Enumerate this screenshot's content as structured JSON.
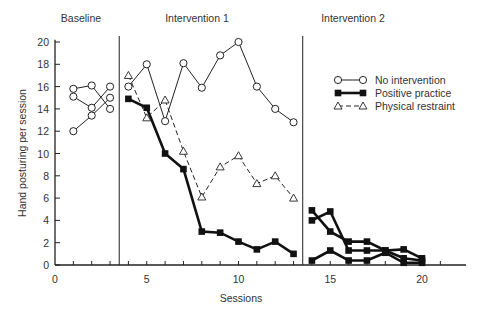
{
  "chart_data": {
    "type": "line",
    "title": "",
    "xlabel": "Sessions",
    "ylabel": "Hand posturing per session",
    "xlim": [
      0,
      22
    ],
    "ylim": [
      0,
      20
    ],
    "x_ticks": [
      0,
      5,
      10,
      15,
      20
    ],
    "y_ticks": [
      0,
      2,
      4,
      6,
      8,
      10,
      12,
      14,
      16,
      18,
      20
    ],
    "grid": false,
    "phases": [
      {
        "label": "Baseline",
        "start": 0,
        "end": 3.5
      },
      {
        "label": "Intervention 1",
        "start": 3.5,
        "end": 13.5
      },
      {
        "label": "Intervention 2",
        "start": 13.5,
        "end": 22
      }
    ],
    "legend": {
      "position": "upper right",
      "entries": [
        {
          "label": "No intervention",
          "marker": "open-circle",
          "line": "solid-thin"
        },
        {
          "label": "Positive practice",
          "marker": "filled-square",
          "line": "solid-thick"
        },
        {
          "label": "Physical restraint",
          "marker": "open-triangle",
          "line": "dashed"
        }
      ]
    },
    "series": [
      {
        "name": "Baseline A",
        "style": "open-circle",
        "points": [
          [
            1,
            15.8
          ],
          [
            2,
            16.1
          ],
          [
            3,
            14.0
          ]
        ]
      },
      {
        "name": "Baseline B",
        "style": "open-circle",
        "points": [
          [
            1,
            15.1
          ],
          [
            2,
            14.1
          ],
          [
            3,
            16.0
          ]
        ]
      },
      {
        "name": "Baseline C",
        "style": "open-circle",
        "points": [
          [
            1,
            12.0
          ],
          [
            2,
            13.4
          ],
          [
            3,
            15.0
          ]
        ]
      },
      {
        "name": "No intervention",
        "style": "open-circle",
        "points": [
          [
            4,
            16.0
          ],
          [
            5,
            18.0
          ],
          [
            6,
            12.9
          ],
          [
            7,
            18.1
          ],
          [
            8,
            15.9
          ],
          [
            9,
            18.8
          ],
          [
            10,
            20.0
          ],
          [
            11,
            16.0
          ],
          [
            12,
            14.0
          ],
          [
            13,
            12.8
          ]
        ]
      },
      {
        "name": "Positive practice",
        "style": "filled-square",
        "points": [
          [
            4,
            14.9
          ],
          [
            5,
            14.1
          ],
          [
            6,
            10.0
          ],
          [
            7,
            8.6
          ],
          [
            8,
            3.0
          ],
          [
            9,
            2.9
          ],
          [
            10,
            2.1
          ],
          [
            11,
            1.4
          ],
          [
            12,
            2.1
          ],
          [
            13,
            1.0
          ]
        ]
      },
      {
        "name": "Physical restraint",
        "style": "open-triangle",
        "points": [
          [
            4,
            17.0
          ],
          [
            5,
            13.2
          ],
          [
            6,
            14.8
          ],
          [
            7,
            10.2
          ],
          [
            8,
            6.1
          ],
          [
            9,
            8.8
          ],
          [
            10,
            9.8
          ],
          [
            11,
            7.3
          ],
          [
            12,
            8.0
          ],
          [
            13,
            6.0
          ]
        ]
      },
      {
        "name": "Intervention 2 A",
        "style": "filled-square",
        "points": [
          [
            14,
            4.9
          ],
          [
            15,
            3.0
          ],
          [
            16,
            2.1
          ],
          [
            17,
            2.1
          ],
          [
            18,
            1.3
          ],
          [
            19,
            0.6
          ],
          [
            20,
            0.4
          ]
        ]
      },
      {
        "name": "Intervention 2 B",
        "style": "filled-square",
        "points": [
          [
            14,
            4.0
          ],
          [
            15,
            4.8
          ],
          [
            16,
            1.3
          ],
          [
            17,
            1.3
          ],
          [
            18,
            1.3
          ],
          [
            19,
            1.4
          ],
          [
            20,
            0.6
          ]
        ]
      },
      {
        "name": "Intervention 2 C",
        "style": "filled-square",
        "points": [
          [
            14,
            0.4
          ],
          [
            15,
            1.3
          ],
          [
            16,
            0.4
          ],
          [
            17,
            0.4
          ],
          [
            18,
            1.1
          ],
          [
            19,
            0.2
          ],
          [
            20,
            0.2
          ]
        ]
      }
    ]
  }
}
